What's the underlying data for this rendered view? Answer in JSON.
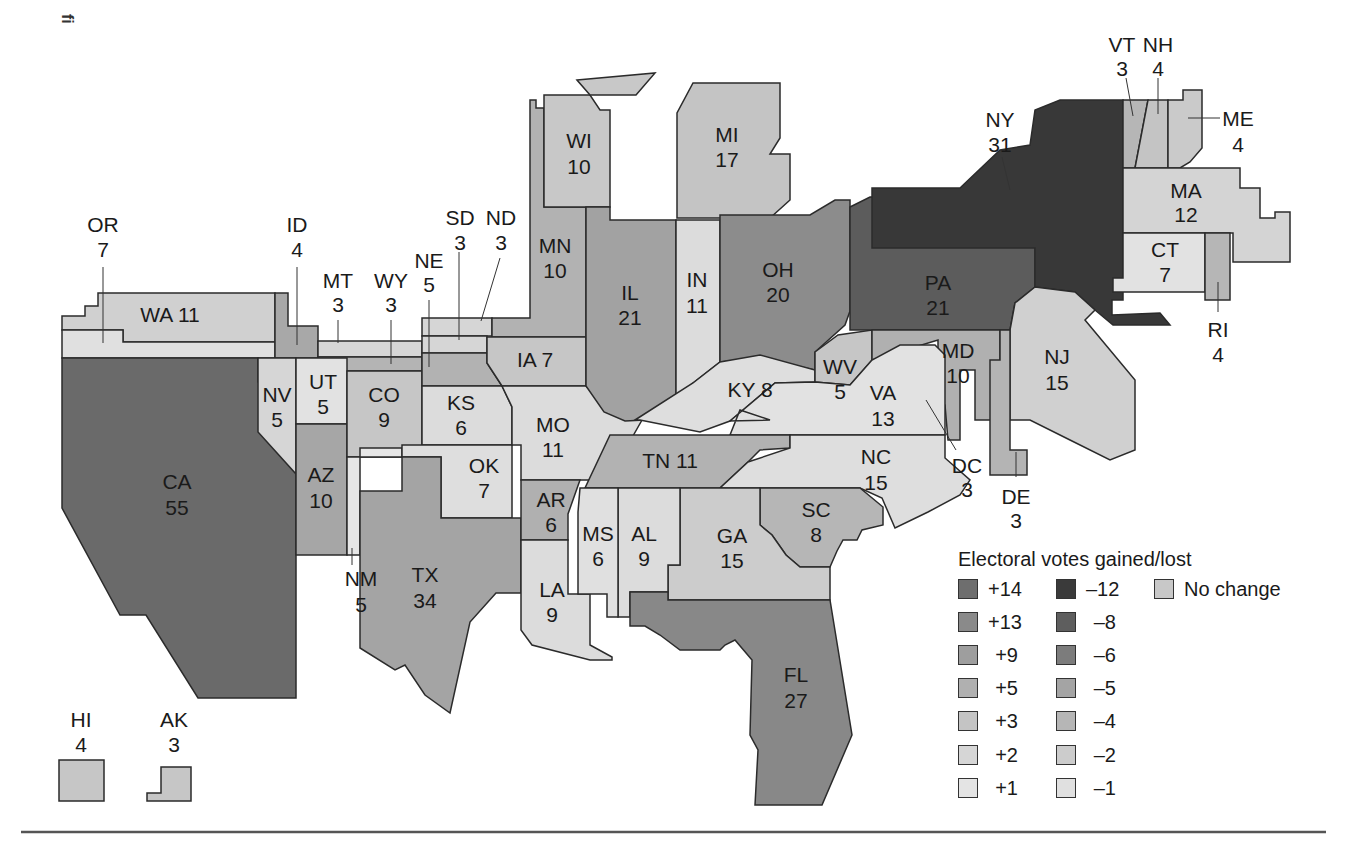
{
  "corner_mark": "fi",
  "map_title": "",
  "legend": {
    "title": "Electoral votes gained/lost",
    "items": [
      {
        "label": "+14",
        "color": "#6e6e6e"
      },
      {
        "label": "+13",
        "color": "#8a8a8a"
      },
      {
        "label": "+9",
        "color": "#9e9e9e"
      },
      {
        "label": "+5",
        "color": "#b0b0b0"
      },
      {
        "label": "+3",
        "color": "#c4c4c4"
      },
      {
        "label": "+2",
        "color": "#d6d6d6"
      },
      {
        "label": "+1",
        "color": "#e4e4e4"
      },
      {
        "label": "–12",
        "color": "#3a3a3a"
      },
      {
        "label": "–8",
        "color": "#5e5e5e"
      },
      {
        "label": "–6",
        "color": "#7c7c7c"
      },
      {
        "label": "–5",
        "color": "#a4a4a4"
      },
      {
        "label": "–4",
        "color": "#b6b6b6"
      },
      {
        "label": "–2",
        "color": "#cccccc"
      },
      {
        "label": "–1",
        "color": "#e0e0e0"
      },
      {
        "label": "No change",
        "color": "#c8c8c8"
      }
    ]
  },
  "states": {
    "WA": {
      "abbr": "WA",
      "votes": "11"
    },
    "OR": {
      "abbr": "OR",
      "votes": "7"
    },
    "ID": {
      "abbr": "ID",
      "votes": "4"
    },
    "MT": {
      "abbr": "MT",
      "votes": "3"
    },
    "WY": {
      "abbr": "WY",
      "votes": "3"
    },
    "NE": {
      "abbr": "NE",
      "votes": "5"
    },
    "SD": {
      "abbr": "SD",
      "votes": "3"
    },
    "ND": {
      "abbr": "ND",
      "votes": "3"
    },
    "MN": {
      "abbr": "MN",
      "votes": "10"
    },
    "WI": {
      "abbr": "WI",
      "votes": "10"
    },
    "MI": {
      "abbr": "MI",
      "votes": "17"
    },
    "IL": {
      "abbr": "IL",
      "votes": "21"
    },
    "IN": {
      "abbr": "IN",
      "votes": "11"
    },
    "OH": {
      "abbr": "OH",
      "votes": "20"
    },
    "PA": {
      "abbr": "PA",
      "votes": "21"
    },
    "NY": {
      "abbr": "NY",
      "votes": "31"
    },
    "VT": {
      "abbr": "VT",
      "votes": "3"
    },
    "NH": {
      "abbr": "NH",
      "votes": "4"
    },
    "ME": {
      "abbr": "ME",
      "votes": "4"
    },
    "MA": {
      "abbr": "MA",
      "votes": "12"
    },
    "CT": {
      "abbr": "CT",
      "votes": "7"
    },
    "RI": {
      "abbr": "RI",
      "votes": "4"
    },
    "NJ": {
      "abbr": "NJ",
      "votes": "15"
    },
    "DE": {
      "abbr": "DE",
      "votes": "3"
    },
    "MD": {
      "abbr": "MD",
      "votes": "10"
    },
    "DC": {
      "abbr": "DC",
      "votes": "3"
    },
    "WV": {
      "abbr": "WV",
      "votes": "5"
    },
    "VA": {
      "abbr": "VA",
      "votes": "13"
    },
    "KY": {
      "abbr": "KY",
      "votes": "8"
    },
    "TN": {
      "abbr": "TN",
      "votes": "11"
    },
    "NC": {
      "abbr": "NC",
      "votes": "15"
    },
    "SC": {
      "abbr": "SC",
      "votes": "8"
    },
    "GA": {
      "abbr": "GA",
      "votes": "15"
    },
    "FL": {
      "abbr": "FL",
      "votes": "27"
    },
    "AL": {
      "abbr": "AL",
      "votes": "9"
    },
    "MS": {
      "abbr": "MS",
      "votes": "6"
    },
    "LA": {
      "abbr": "LA",
      "votes": "9"
    },
    "AR": {
      "abbr": "AR",
      "votes": "6"
    },
    "MO": {
      "abbr": "MO",
      "votes": "11"
    },
    "IA": {
      "abbr": "IA",
      "votes": "7"
    },
    "KS": {
      "abbr": "KS",
      "votes": "6"
    },
    "OK": {
      "abbr": "OK",
      "votes": "7"
    },
    "TX": {
      "abbr": "TX",
      "votes": "34"
    },
    "NM": {
      "abbr": "NM",
      "votes": "5"
    },
    "CO": {
      "abbr": "CO",
      "votes": "9"
    },
    "UT": {
      "abbr": "UT",
      "votes": "5"
    },
    "AZ": {
      "abbr": "AZ",
      "votes": "10"
    },
    "NV": {
      "abbr": "NV",
      "votes": "5"
    },
    "CA": {
      "abbr": "CA",
      "votes": "55"
    },
    "HI": {
      "abbr": "HI",
      "votes": "4"
    },
    "AK": {
      "abbr": "AK",
      "votes": "3"
    }
  }
}
